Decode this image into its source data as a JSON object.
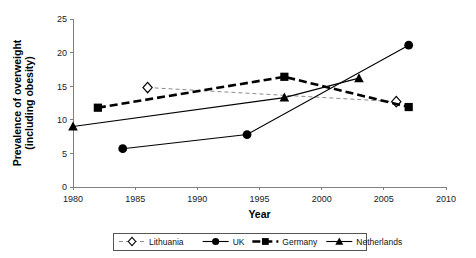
{
  "chart_data": {
    "type": "line",
    "title": "",
    "xlabel": "Year",
    "ylabel": "Prevalence of overweight (including obesity)",
    "xlim": [
      1980,
      2010
    ],
    "ylim": [
      0,
      25
    ],
    "xticks": [
      1980,
      1985,
      1990,
      1995,
      2000,
      2005,
      2010
    ],
    "yticks": [
      0,
      5,
      10,
      15,
      20,
      25
    ],
    "grid": false,
    "legend_position": "bottom",
    "series": [
      {
        "name": "Lithuania",
        "marker": "open-diamond",
        "line_style": "thin-dashed",
        "color": "#808080",
        "x": [
          1986,
          2006
        ],
        "values": [
          14.8,
          12.7
        ]
      },
      {
        "name": "UK",
        "marker": "filled-circle",
        "line_style": "thin-solid",
        "color": "#000000",
        "x": [
          1984,
          1994,
          2007
        ],
        "values": [
          5.7,
          7.8,
          21.1
        ]
      },
      {
        "name": "Germany",
        "marker": "filled-square",
        "line_style": "thick-dashed",
        "color": "#000000",
        "x": [
          1982,
          1997,
          2007
        ],
        "values": [
          11.8,
          16.4,
          11.9
        ]
      },
      {
        "name": "Netherlands",
        "marker": "filled-triangle",
        "line_style": "thin-solid",
        "color": "#000000",
        "x": [
          1980,
          1997,
          2003
        ],
        "values": [
          9.0,
          13.3,
          16.2
        ]
      }
    ]
  },
  "legend": {
    "entries": [
      {
        "label": "Lithuania"
      },
      {
        "label": "UK"
      },
      {
        "label": "Germany"
      },
      {
        "label": "Netherlands"
      }
    ]
  },
  "axes": {
    "y_title": "Prevalence of overweight (including obesity)",
    "x_title": "Year"
  }
}
